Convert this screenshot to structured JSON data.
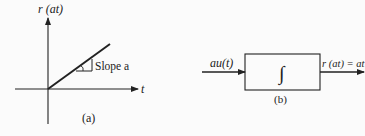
{
  "figure_a": {
    "y_axis_label": "r (at)",
    "x_axis_label": "t",
    "slope_label": "Slope a",
    "caption": "(a)"
  },
  "figure_b": {
    "input_label": "au(t)",
    "block_symbol": "∫",
    "output_label": "r (at) = at",
    "caption": "(b)"
  },
  "colors": {
    "ink": "#222222",
    "background": "#fbfbfb"
  }
}
